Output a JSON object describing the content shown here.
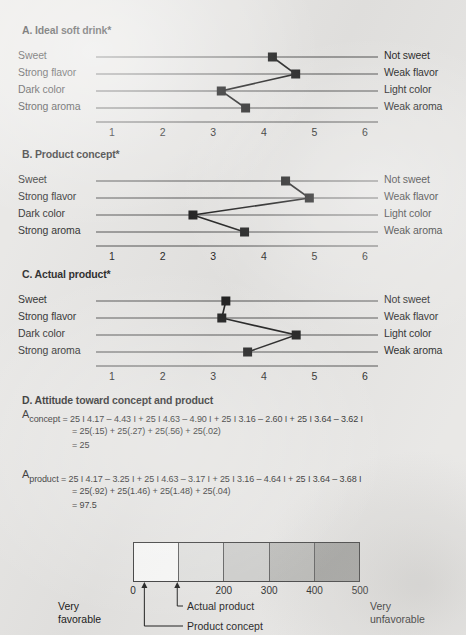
{
  "figure": {
    "background_color": "#e9e8e6",
    "ink_color": "#1b1b1b"
  },
  "panels": [
    {
      "id": "A",
      "title": "A. Ideal soft drink*",
      "left_labels": [
        "Sweet",
        "Strong flavor",
        "Dark color",
        "Strong aroma"
      ],
      "right_labels": [
        "Not sweet",
        "Weak flavor",
        "Light color",
        "Weak aroma"
      ],
      "axis_ticks": [
        "1",
        "2",
        "3",
        "4",
        "5",
        "6"
      ],
      "values": [
        4.17,
        4.63,
        3.16,
        3.64
      ]
    },
    {
      "id": "B",
      "title": "B. Product concept*",
      "left_labels": [
        "Sweet",
        "Strong flavor",
        "Dark color",
        "Strong aroma"
      ],
      "right_labels": [
        "Not sweet",
        "Weak flavor",
        "Light color",
        "Weak aroma"
      ],
      "axis_ticks": [
        "1",
        "2",
        "3",
        "4",
        "5",
        "6"
      ],
      "values": [
        4.43,
        4.9,
        2.6,
        3.62
      ]
    },
    {
      "id": "C",
      "title": "C. Actual product*",
      "left_labels": [
        "Sweet",
        "Strong flavor",
        "Dark color",
        "Strong aroma"
      ],
      "right_labels": [
        "Not sweet",
        "Weak flavor",
        "Light color",
        "Weak aroma"
      ],
      "axis_ticks": [
        "1",
        "2",
        "3",
        "4",
        "5",
        "6"
      ],
      "values": [
        3.25,
        3.17,
        4.64,
        3.68
      ]
    }
  ],
  "attitude": {
    "title": "D. Attitude toward concept and product",
    "concept": {
      "symbol": "A",
      "subscript": "concept",
      "line1": "= 25 I 4.17 – 4.43 I + 25 I 4.63 – 4.90 I + 25 I 3.16 – 2.60 I + 25 I 3.64 – 3.62 I",
      "line2": "= 25(.15) + 25(.27) + 25(.56) + 25(.02)",
      "line3": "= 25"
    },
    "product": {
      "symbol": "A",
      "subscript": "product",
      "line1": "= 25 I 4.17 – 3.25 I + 25 I 4.63 – 3.17 I + 25 I 3.16 – 4.64 I + 25 I 3.64 – 3.68 I",
      "line2": "= 25(.92) + 25(1.46) + 25(1.48) + 25(.04)",
      "line3": "= 97.5"
    }
  },
  "scale": {
    "cells": [
      "#fdfdfc",
      "#e3e3e1",
      "#cfcfcd",
      "#bcbcb9",
      "#a6a6a3"
    ],
    "ticks": [
      {
        "label": "0",
        "value": 0
      },
      {
        "label": "200",
        "value": 200
      },
      {
        "label": "300",
        "value": 300
      },
      {
        "label": "400",
        "value": 400
      },
      {
        "label": "500",
        "value": 500
      }
    ],
    "markers": [
      {
        "label": "Product concept",
        "value": 25
      },
      {
        "label": "Actual product",
        "value": 97.5
      }
    ],
    "left_label_line1": "Very",
    "left_label_line2": "favorable",
    "right_label_line1": "Very",
    "right_label_line2": "unfavorable"
  },
  "chart_data": {
    "type": "line",
    "orientation": "horizontal-semantic-differential",
    "xlabel": "",
    "ylabel": "",
    "xlim": [
      1,
      6
    ],
    "x_ticks": [
      1,
      2,
      3,
      4,
      5,
      6
    ],
    "grid": false,
    "legend_position": "none",
    "categories": [
      "Sweet / Not sweet",
      "Strong flavor / Weak flavor",
      "Dark color / Light color",
      "Strong aroma / Weak aroma"
    ],
    "series": [
      {
        "name": "A. Ideal soft drink",
        "values": [
          4.17,
          4.63,
          3.16,
          3.64
        ]
      },
      {
        "name": "B. Product concept",
        "values": [
          4.43,
          4.9,
          2.6,
          3.62
        ]
      },
      {
        "name": "C. Actual product",
        "values": [
          3.25,
          3.17,
          4.64,
          3.68
        ]
      }
    ],
    "annotations": [
      "A_concept = 25 I 4.17 - 4.43 I + 25 I 4.63 - 4.90 I + 25 I 3.16 - 2.60 I + 25 I 3.64 - 3.62 I = 25",
      "A_product = 25 I 4.17 - 3.25 I + 25 I 4.63 - 3.17 I + 25 I 3.16 - 4.64 I + 25 I 3.64 - 3.68 I = 97.5"
    ],
    "attitude_scale": {
      "type": "bar",
      "xlim": [
        0,
        500
      ],
      "x_ticks": [
        0,
        100,
        200,
        300,
        400,
        500
      ],
      "markers": {
        "Product concept": 25,
        "Actual product": 97.5
      },
      "left_anchor": "Very favorable",
      "right_anchor": "Very unfavorable"
    }
  }
}
